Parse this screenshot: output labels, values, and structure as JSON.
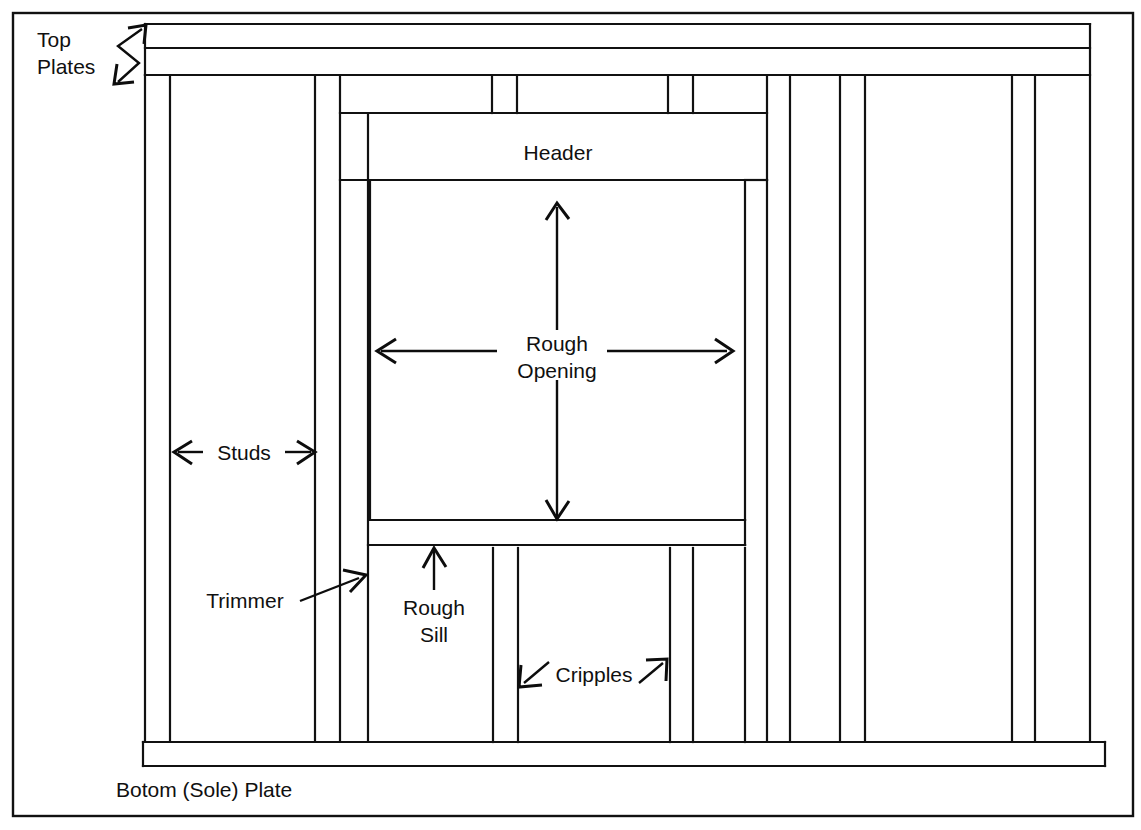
{
  "diagram": {
    "labels": {
      "top_plates_line1": "Top",
      "top_plates_line2": "Plates",
      "header": "Header",
      "rough_opening_line1": "Rough",
      "rough_opening_line2": "Opening",
      "studs": "Studs",
      "trimmer": "Trimmer",
      "rough_sill_line1": "Rough",
      "rough_sill_line2": "Sill",
      "cripples": "Cripples",
      "bottom_plate": "Botom (Sole) Plate"
    },
    "colors": {
      "line": "#111111",
      "text": "#101010",
      "background": "#ffffff"
    },
    "components": [
      {
        "name": "top-plate-upper",
        "kind": "horizontal-band"
      },
      {
        "name": "top-plate-lower",
        "kind": "horizontal-band"
      },
      {
        "name": "header",
        "kind": "box"
      },
      {
        "name": "rough-opening",
        "kind": "box"
      },
      {
        "name": "rough-sill",
        "kind": "horizontal-band"
      },
      {
        "name": "bottom-sole-plate",
        "kind": "horizontal-band"
      },
      {
        "name": "studs",
        "kind": "vertical-members"
      },
      {
        "name": "trimmer",
        "kind": "vertical-member"
      },
      {
        "name": "cripples",
        "kind": "vertical-members"
      }
    ]
  }
}
